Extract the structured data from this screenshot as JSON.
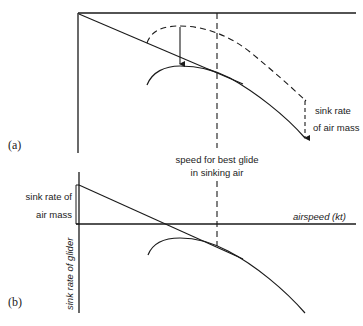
{
  "figure": {
    "colors": {
      "ink": "#1a1a1a",
      "background": "#ffffff"
    },
    "panel_a": {
      "label": "(a)",
      "annotation_sink": [
        "sink rate",
        "of air mass"
      ],
      "annotation_speed": [
        "speed for best glide",
        "in sinking air"
      ]
    },
    "panel_b": {
      "label": "(b)",
      "annotation_sink": [
        "sink rate of",
        "air mass"
      ],
      "x_axis_label": "airspeed (kt)",
      "y_axis_label": "sink rate of glider"
    }
  }
}
